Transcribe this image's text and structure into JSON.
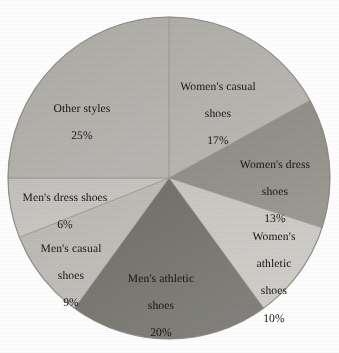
{
  "chart_data": {
    "type": "pie",
    "title": "",
    "subtitle": "",
    "xlabel": "",
    "ylabel": "",
    "legend_position": "none",
    "grid": false,
    "labels_inside_slices": true,
    "start_angle_deg": 0,
    "direction": "clockwise",
    "total": 100,
    "unit": "%",
    "categories": [
      "Women's casual shoes",
      "Women's dress shoes",
      "Women's athletic shoes",
      "Men's athletic shoes",
      "Men's casual shoes",
      "Men's dress shoes",
      "Other styles"
    ],
    "values": [
      17,
      13,
      10,
      20,
      9,
      6,
      25
    ],
    "slices": [
      {
        "name": "Women's casual shoes",
        "label_line1": "Women's casual",
        "label_line2": "shoes",
        "value": 17,
        "value_label": "17%",
        "color": "#b0aea9",
        "start_pct": 0,
        "end_pct": 17
      },
      {
        "name": "Women's dress shoes",
        "label_line1": "Women's dress",
        "label_line2": "shoes",
        "value": 13,
        "value_label": "13%",
        "color": "#8b8981",
        "start_pct": 17,
        "end_pct": 30
      },
      {
        "name": "Women's athletic shoes",
        "label_line1": "Women's",
        "label_line2": "athletic",
        "label_line3": "shoes",
        "value": 10,
        "value_label": "10%",
        "color": "#c9c7c2",
        "start_pct": 30,
        "end_pct": 40
      },
      {
        "name": "Men's athletic shoes",
        "label_line1": "Men's athletic",
        "label_line2": "shoes",
        "value": 20,
        "value_label": "20%",
        "color": "#6f6d67",
        "start_pct": 40,
        "end_pct": 60
      },
      {
        "name": "Men's casual shoes",
        "label_line1": "Men's casual",
        "label_line2": "shoes",
        "value": 9,
        "value_label": "9%",
        "color": "#b9b7b2",
        "start_pct": 60,
        "end_pct": 69
      },
      {
        "name": "Men's dress shoes",
        "label_line1": "Men's dress shoes",
        "value": 6,
        "value_label": "6%",
        "color": "#c3c1bc",
        "start_pct": 69,
        "end_pct": 75
      },
      {
        "name": "Other styles",
        "label_line1": "Other styles",
        "value": 25,
        "value_label": "25%",
        "color": "#acaaa5",
        "start_pct": 75,
        "end_pct": 100
      }
    ],
    "geometry": {
      "center_x": 169,
      "center_y": 178,
      "radius": 161
    },
    "colors": {
      "background": "#ffffff",
      "label_text": "#161412",
      "slice_edge": "#9a9892"
    }
  }
}
